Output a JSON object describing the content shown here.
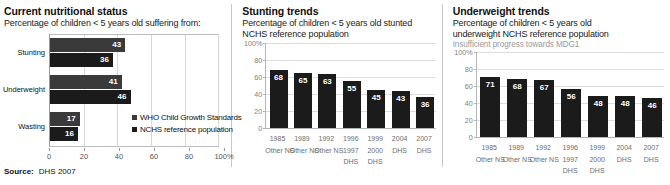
{
  "colors": {
    "who_bar": "#3a3a3a",
    "nchs_bar": "#1b1b1b",
    "grid": "#dedede",
    "axis": "#b5b5b5",
    "note_text": "#9a9a9a"
  },
  "panel1": {
    "title": "Current nutritional status",
    "subtitle": "Percentage of children < 5 years old suffering from:",
    "legend": [
      {
        "label": "WHO Child Growth Standards",
        "color": "#3a3a3a"
      },
      {
        "label": "NCHS reference population",
        "color": "#1b1b1b"
      }
    ],
    "source_label": "Source:",
    "source_value": "DHS 2007",
    "chart_data": {
      "type": "bar",
      "orientation": "horizontal",
      "title": "Current nutritional status",
      "xlabel": "",
      "ylabel": "",
      "xlim": [
        0,
        100
      ],
      "grid": true,
      "legend_position": "inside-bottom-right",
      "categories": [
        "Stunting",
        "Underweight",
        "Wasting"
      ],
      "tick_labels": [
        "0",
        "20",
        "40",
        "60",
        "80",
        "100%"
      ],
      "tick_values": [
        0,
        20,
        40,
        60,
        80,
        100
      ],
      "series": [
        {
          "name": "WHO Child Growth Standards",
          "values": [
            43,
            41,
            17
          ]
        },
        {
          "name": "NCHS reference population",
          "values": [
            36,
            46,
            16
          ]
        }
      ]
    }
  },
  "panel2": {
    "title": "Stunting trends",
    "subtitle_line1": "Percentage of children < 5 years old stunted",
    "subtitle_line2": "NCHS reference population",
    "chart_data": {
      "type": "bar",
      "orientation": "vertical",
      "title": "Stunting trends",
      "xlabel": "",
      "ylabel": "",
      "ylim": [
        0,
        100
      ],
      "grid": true,
      "legend_position": "none",
      "tick_labels": [
        "100%",
        "80",
        "60",
        "40",
        "20",
        "0"
      ],
      "tick_values": [
        100,
        80,
        60,
        40,
        20,
        0
      ],
      "categories": [
        [
          "1985",
          "Other NS"
        ],
        [
          "1989",
          "Other NS"
        ],
        [
          "1992",
          "Other NS"
        ],
        [
          "1996",
          "1997",
          "DHS"
        ],
        [
          "1999",
          "2000",
          "DHS"
        ],
        [
          "2004",
          "DHS"
        ],
        [
          "2007",
          "DHS"
        ]
      ],
      "values": [
        68,
        65,
        63,
        55,
        45,
        43,
        36
      ]
    }
  },
  "panel3": {
    "title": "Underweight trends",
    "subtitle_line1": "Percentage of children < 5 years old",
    "subtitle_line2": "underweight NCHS reference population",
    "note": "Insufficient progress towards MDG1",
    "chart_data": {
      "type": "bar",
      "orientation": "vertical",
      "title": "Underweight trends",
      "xlabel": "",
      "ylabel": "",
      "ylim": [
        0,
        100
      ],
      "grid": true,
      "legend_position": "none",
      "tick_labels": [
        "100%",
        "80",
        "60",
        "40",
        "20",
        "0"
      ],
      "tick_values": [
        100,
        80,
        60,
        40,
        20,
        0
      ],
      "categories": [
        [
          "1985",
          "Other NS"
        ],
        [
          "1989",
          "Other NS"
        ],
        [
          "1992",
          "Other NS"
        ],
        [
          "1996",
          "1997",
          "DHS"
        ],
        [
          "1999",
          "2000",
          "DHS"
        ],
        [
          "2004",
          "DHS"
        ],
        [
          "2007",
          "DHS"
        ]
      ],
      "values": [
        71,
        68,
        67,
        56,
        48,
        48,
        46
      ]
    }
  }
}
